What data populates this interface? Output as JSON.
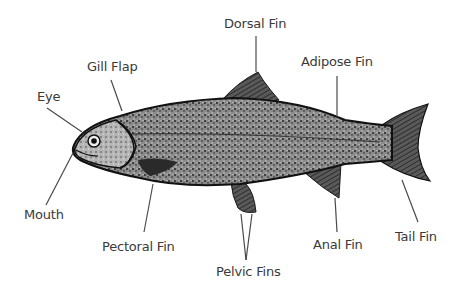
{
  "labels": {
    "dorsal_fin": "Dorsal Fin",
    "adipose_fin": "Adipose Fin",
    "gill_flap": "Gill Flap",
    "eye": "Eye",
    "mouth": "Mouth",
    "pectoral_fin": "Pectoral Fin",
    "pelvic_fins": "Pelvic Fins",
    "anal_fin": "Anal Fin",
    "tail_fin": "Tail Fin"
  },
  "colors": {
    "label_text": "#3a3a3a",
    "leader_line": "#4a4a4a",
    "fish_dark": "#1a1a1a",
    "fish_mid": "#6a6a6a",
    "background": "#ffffff"
  }
}
